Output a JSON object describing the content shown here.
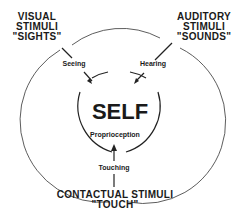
{
  "diagram": {
    "center_label": "SELF",
    "inner_label": "Proprioception",
    "stimuli": [
      {
        "line1": "VISUAL",
        "line2": "STIMULI",
        "line3": "\"SIGHTS\"",
        "sense": "Seeing"
      },
      {
        "line1": "AUDITORY",
        "line2": "STIMULI",
        "line3": "\"SOUNDS\"",
        "sense": "Hearing"
      },
      {
        "line1": "CONTACTUAL STIMULI",
        "line2": "\"TOUCH\"",
        "sense": "Touching"
      }
    ]
  }
}
